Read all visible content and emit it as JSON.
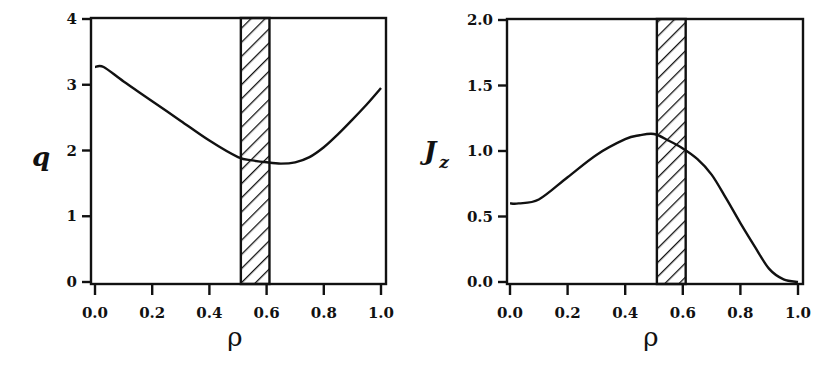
{
  "chart_data": [
    {
      "type": "line",
      "title": "",
      "xlabel": "ρ",
      "ylabel": "q",
      "xlim": [
        0.0,
        1.0
      ],
      "ylim": [
        0,
        4
      ],
      "xticks": [
        "0.0",
        "0.2",
        "0.4",
        "0.6",
        "0.8",
        "1.0"
      ],
      "yticks": [
        "0",
        "1",
        "2",
        "3",
        "4"
      ],
      "grid": false,
      "legend": null,
      "shaded_band": {
        "x_start": 0.51,
        "x_end": 0.61,
        "pattern": "diagonal-hatch"
      },
      "series": [
        {
          "name": "q",
          "x": [
            0.0,
            0.03,
            0.1,
            0.2,
            0.3,
            0.4,
            0.5,
            0.55,
            0.6,
            0.65,
            0.7,
            0.75,
            0.8,
            0.85,
            0.9,
            0.95,
            1.0
          ],
          "y": [
            3.27,
            3.27,
            3.05,
            2.75,
            2.45,
            2.15,
            1.9,
            1.85,
            1.82,
            1.8,
            1.82,
            1.9,
            2.05,
            2.25,
            2.47,
            2.7,
            2.95
          ]
        }
      ]
    },
    {
      "type": "line",
      "title": "",
      "xlabel": "ρ",
      "ylabel": "J_z",
      "xlim": [
        0.0,
        1.0
      ],
      "ylim": [
        0.0,
        2.0
      ],
      "xticks": [
        "0.0",
        "0.2",
        "0.4",
        "0.6",
        "0.8",
        "1.0"
      ],
      "yticks": [
        "0.0",
        "0.5",
        "1.0",
        "1.5",
        "2.0"
      ],
      "grid": false,
      "legend": null,
      "shaded_band": {
        "x_start": 0.51,
        "x_end": 0.61,
        "pattern": "diagonal-hatch"
      },
      "series": [
        {
          "name": "J_z",
          "x": [
            0.0,
            0.03,
            0.1,
            0.2,
            0.3,
            0.4,
            0.45,
            0.5,
            0.55,
            0.6,
            0.65,
            0.7,
            0.75,
            0.8,
            0.85,
            0.9,
            0.95,
            1.0
          ],
          "y": [
            0.6,
            0.6,
            0.63,
            0.8,
            0.97,
            1.09,
            1.12,
            1.13,
            1.08,
            1.02,
            0.94,
            0.82,
            0.64,
            0.45,
            0.27,
            0.1,
            0.02,
            0.0
          ]
        }
      ]
    }
  ],
  "panels": {
    "left": {
      "ylabel_main": "q",
      "ylabel_sub": "",
      "xlabel": "ρ",
      "yticks": [
        "0",
        "1",
        "2",
        "3",
        "4"
      ],
      "xticks": [
        "0.0",
        "0.2",
        "0.4",
        "0.6",
        "0.8",
        "1.0"
      ]
    },
    "right": {
      "ylabel_main": "J",
      "ylabel_sub": "z",
      "xlabel": "ρ",
      "yticks": [
        "0.0",
        "0.5",
        "1.0",
        "1.5",
        "2.0"
      ],
      "xticks": [
        "0.0",
        "0.2",
        "0.4",
        "0.6",
        "0.8",
        "1.0"
      ]
    }
  }
}
